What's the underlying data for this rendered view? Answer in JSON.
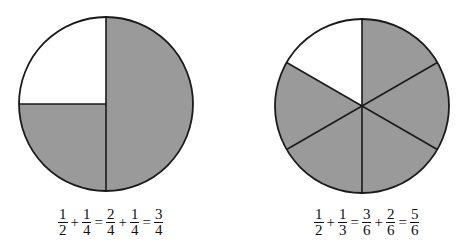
{
  "colors": {
    "shaded": "#9a9a9a",
    "unshaded": "#ffffff",
    "stroke": "#1a1a1a"
  },
  "left_figure": {
    "name": "quarters-circle",
    "divisions": 4,
    "shaded_parts": 3,
    "equation": {
      "terms": [
        {
          "num": "1",
          "den": "2"
        },
        {
          "op": "+"
        },
        {
          "num": "1",
          "den": "4"
        },
        {
          "op": "="
        },
        {
          "num": "2",
          "den": "4"
        },
        {
          "op": "+"
        },
        {
          "num": "1",
          "den": "4"
        },
        {
          "op": "="
        },
        {
          "num": "3",
          "den": "4"
        }
      ]
    }
  },
  "right_figure": {
    "name": "sixths-circle",
    "divisions": 6,
    "shaded_parts": 5,
    "equation": {
      "terms": [
        {
          "num": "1",
          "den": "2"
        },
        {
          "op": "+"
        },
        {
          "num": "1",
          "den": "3"
        },
        {
          "op": "="
        },
        {
          "num": "3",
          "den": "6"
        },
        {
          "op": "+"
        },
        {
          "num": "2",
          "den": "6"
        },
        {
          "op": "="
        },
        {
          "num": "5",
          "den": "6"
        }
      ]
    }
  }
}
